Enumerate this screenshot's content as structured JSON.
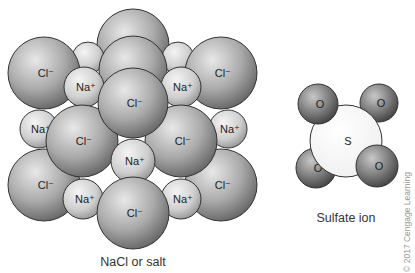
{
  "figure": {
    "nacl": {
      "caption": "NaCl or salt",
      "chloride_label": "Cl⁻",
      "sodium_label": "Na⁺",
      "spheres": [
        {
          "ion": "Cl",
          "cx": 133,
          "cy": 45,
          "r": 36,
          "label": ""
        },
        {
          "ion": "Na",
          "cx": 88,
          "cy": 58,
          "r": 16,
          "label": ""
        },
        {
          "ion": "Na",
          "cx": 178,
          "cy": 58,
          "r": 16,
          "label": ""
        },
        {
          "ion": "Cl",
          "cx": 133,
          "cy": 70,
          "r": 34,
          "label": ""
        },
        {
          "ion": "Cl",
          "cx": 44,
          "cy": 73,
          "r": 36,
          "label": "Cl⁻"
        },
        {
          "ion": "Cl",
          "cx": 221,
          "cy": 73,
          "r": 36,
          "label": "Cl⁻"
        },
        {
          "ion": "Na",
          "cx": 84,
          "cy": 87,
          "r": 20,
          "label": "Na⁺"
        },
        {
          "ion": "Na",
          "cx": 181,
          "cy": 87,
          "r": 20,
          "label": "Na⁺"
        },
        {
          "ion": "Na",
          "cx": 39,
          "cy": 129,
          "r": 19,
          "label": "Na⁺"
        },
        {
          "ion": "Na",
          "cx": 228,
          "cy": 129,
          "r": 19,
          "label": "Na⁺"
        },
        {
          "ion": "Cl",
          "cx": 44,
          "cy": 185,
          "r": 36,
          "label": "Cl⁻"
        },
        {
          "ion": "Cl",
          "cx": 221,
          "cy": 185,
          "r": 36,
          "label": "Cl⁻"
        },
        {
          "ion": "Cl",
          "cx": 82,
          "cy": 141,
          "r": 36,
          "label": "Cl⁻"
        },
        {
          "ion": "Cl",
          "cx": 181,
          "cy": 141,
          "r": 36,
          "label": "Cl⁻"
        },
        {
          "ion": "Cl",
          "cx": 133,
          "cy": 103,
          "r": 35,
          "label": "Cl⁻"
        },
        {
          "ion": "Na",
          "cx": 133,
          "cy": 161,
          "r": 22,
          "label": "Na⁺"
        },
        {
          "ion": "Na",
          "cx": 83,
          "cy": 199,
          "r": 20,
          "label": "Na⁺"
        },
        {
          "ion": "Na",
          "cx": 181,
          "cy": 199,
          "r": 20,
          "label": "Na⁺"
        },
        {
          "ion": "Cl",
          "cx": 133,
          "cy": 213,
          "r": 36,
          "label": "Cl⁻"
        }
      ]
    },
    "sulfate": {
      "caption": "Sulfate ion",
      "sulfur_label": "S",
      "oxygen_label": "O",
      "spheres": [
        {
          "ion": "O",
          "cx": 379,
          "cy": 103,
          "r": 19,
          "label": "O"
        },
        {
          "ion": "O",
          "cx": 316,
          "cy": 168,
          "r": 20,
          "label": "O"
        },
        {
          "ion": "S",
          "cx": 346,
          "cy": 141,
          "r": 36,
          "label": "S"
        },
        {
          "ion": "O",
          "cx": 318,
          "cy": 104,
          "r": 20,
          "label": "O"
        },
        {
          "ion": "O",
          "cx": 377,
          "cy": 166,
          "r": 21,
          "label": "O"
        }
      ]
    },
    "copyright": "© 2017 Cengage Learning",
    "colors": {
      "chloride_light": "#e6e6e6",
      "chloride_dark": "#6a6a6a",
      "sodium_light": "#f0f0f0",
      "sodium_dark": "#9a9a9a",
      "oxygen_light": "#bdbdbd",
      "oxygen_dark": "#4a4a4a",
      "sulfur": "#f7f7f7",
      "outline": "#333333"
    }
  }
}
